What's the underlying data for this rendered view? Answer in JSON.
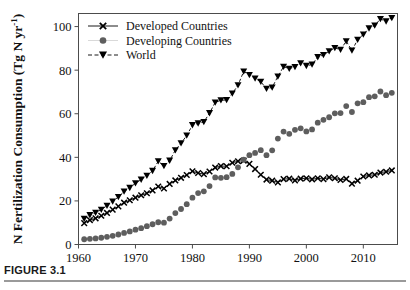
{
  "figure": {
    "caption_label": "FIGURE 3.1"
  },
  "chart_data": {
    "type": "line",
    "title": "",
    "subtitle": "",
    "xlabel": "",
    "ylabel": "N Fertilization Consumption (Tg N yr-1)",
    "ylabel_main": "N Fertilization Consumption (Tg N yr",
    "ylabel_sup": "-1",
    "ylabel_close": ")",
    "xlim": [
      1960,
      2016
    ],
    "ylim": [
      0,
      106
    ],
    "grid": false,
    "legend_position": "top-left",
    "xticks": [
      1960,
      1970,
      1980,
      1990,
      2000,
      2010
    ],
    "xtick_labels": [
      "1960",
      "1970",
      "1980",
      "1990",
      "2000",
      "2010"
    ],
    "yticks": [
      0,
      20,
      40,
      60,
      80,
      100
    ],
    "ytick_labels": [
      "0",
      "20",
      "40",
      "60",
      "80",
      "100"
    ],
    "x": [
      1961,
      1962,
      1963,
      1964,
      1965,
      1966,
      1967,
      1968,
      1969,
      1970,
      1971,
      1972,
      1973,
      1974,
      1975,
      1976,
      1977,
      1978,
      1979,
      1980,
      1981,
      1982,
      1983,
      1984,
      1985,
      1986,
      1987,
      1988,
      1989,
      1990,
      1991,
      1992,
      1993,
      1994,
      1995,
      1996,
      1997,
      1998,
      1999,
      2000,
      2001,
      2002,
      2003,
      2004,
      2005,
      2006,
      2007,
      2008,
      2009,
      2010,
      2011,
      2012,
      2013,
      2014,
      2015
    ],
    "series": [
      {
        "name": "Developed Countries",
        "marker": "x",
        "color": "#000000",
        "linestyle": "solid",
        "values": [
          9.8,
          11.2,
          12.0,
          13.2,
          14.5,
          16.0,
          17.5,
          19.2,
          20.3,
          21.5,
          22.6,
          23.5,
          24.8,
          26.6,
          25.7,
          27.8,
          29.4,
          30.6,
          31.9,
          33.6,
          32.8,
          32.3,
          33.5,
          35.3,
          36.0,
          35.9,
          37.5,
          38.2,
          38.5,
          37.0,
          34.6,
          32.0,
          29.8,
          29.3,
          28.5,
          30.0,
          30.2,
          29.4,
          30.2,
          30.4,
          29.9,
          30.4,
          30.0,
          30.8,
          30.4,
          29.6,
          30.1,
          27.9,
          29.3,
          31.2,
          31.7,
          32.0,
          33.0,
          33.4,
          34.0
        ]
      },
      {
        "name": "Developing Countries",
        "marker": "circle",
        "color": "#5e5e5e",
        "linestyle": "none",
        "values": [
          2.4,
          2.6,
          2.8,
          3.1,
          3.5,
          4.0,
          4.6,
          5.3,
          6.0,
          6.8,
          7.5,
          8.4,
          9.3,
          10.2,
          10.0,
          11.9,
          14.4,
          16.3,
          18.5,
          21.5,
          23.6,
          24.4,
          26.8,
          30.8,
          30.6,
          30.9,
          32.4,
          35.4,
          38.9,
          41.0,
          42.0,
          43.3,
          41.0,
          43.2,
          48.6,
          51.8,
          50.8,
          52.6,
          53.3,
          51.9,
          52.8,
          55.9,
          57.2,
          58.4,
          60.2,
          60.3,
          63.5,
          60.8,
          64.8,
          65.3,
          67.6,
          68.0,
          70.2,
          68.5,
          69.6
        ]
      },
      {
        "name": "World",
        "marker": "triangle-down",
        "color": "#000000",
        "linestyle": "dashed",
        "values": [
          11.8,
          13.5,
          14.6,
          16.0,
          17.8,
          19.8,
          21.8,
          24.3,
          26.0,
          28.1,
          29.8,
          31.6,
          33.8,
          38.2,
          36.0,
          38.5,
          43.3,
          46.5,
          50.0,
          54.8,
          55.6,
          56.2,
          60.3,
          65.2,
          66.2,
          66.3,
          69.3,
          73.1,
          79.4,
          77.8,
          76.2,
          74.7,
          71.5,
          72.1,
          77.1,
          81.6,
          80.7,
          81.5,
          83.2,
          82.0,
          82.6,
          86.0,
          87.0,
          88.7,
          90.2,
          89.4,
          93.3,
          89.0,
          94.0,
          96.4,
          99.2,
          100.5,
          103.5,
          102.4,
          104.0
        ]
      }
    ],
    "legend": [
      {
        "label": "Developed Countries",
        "marker": "x",
        "color": "#000000"
      },
      {
        "label": "Developing Countries",
        "marker": "circle",
        "color": "#5e5e5e"
      },
      {
        "label": "World",
        "marker": "triangle-down",
        "color": "#000000"
      }
    ]
  }
}
